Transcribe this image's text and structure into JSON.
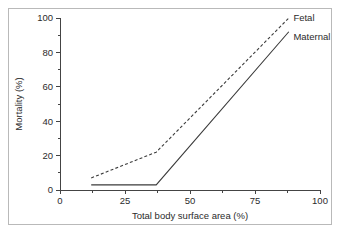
{
  "chart_data": {
    "type": "line",
    "title": "",
    "xlabel": "Total body surface area (%)",
    "ylabel": "Mortality (%)",
    "xlim": [
      0,
      100
    ],
    "ylim": [
      0,
      100
    ],
    "grid": false,
    "legend_position": "inline-right-end",
    "x_ticks": [
      0,
      25,
      50,
      75,
      100
    ],
    "x_tick_labels": [
      "0",
      "25",
      "50",
      "75",
      "100"
    ],
    "x_minor_ticks": [
      12.5,
      37.5,
      62.5,
      87.5
    ],
    "y_ticks": [
      0,
      20,
      40,
      60,
      80,
      100
    ],
    "y_tick_labels": [
      "0",
      "20",
      "40",
      "60",
      "80",
      "100"
    ],
    "y_minor_ticks": [
      10,
      30,
      50,
      70,
      90
    ],
    "series": [
      {
        "name": "Fetal",
        "style": "dashed",
        "color": "#3b3b3b",
        "points": [
          {
            "x": 12,
            "y": 7
          },
          {
            "x": 37,
            "y": 22
          },
          {
            "x": 88,
            "y": 100
          }
        ]
      },
      {
        "name": "Maternal",
        "style": "solid",
        "color": "#3b3b3b",
        "points": [
          {
            "x": 12,
            "y": 3
          },
          {
            "x": 37,
            "y": 3
          },
          {
            "x": 88,
            "y": 92
          }
        ]
      }
    ],
    "annotations": [
      {
        "text": "Fetal",
        "x": 89,
        "y": 100
      },
      {
        "text": "Maternal",
        "x": 89,
        "y": 89
      }
    ]
  },
  "figure": {
    "frame_color": "#b9b9b9",
    "background": "#ffffff",
    "axis_color": "#444444"
  }
}
